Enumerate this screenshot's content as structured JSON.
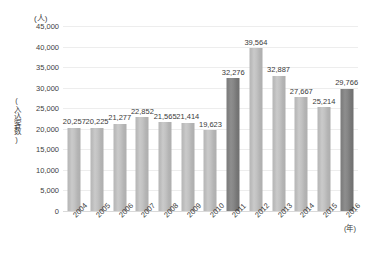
{
  "chart_data": {
    "type": "bar",
    "title": "",
    "subtitle": "",
    "unit_caption": "(人)",
    "ylabel": "(入込客数)",
    "xlabel": "(年)",
    "categories": [
      "2004",
      "2005",
      "2006",
      "2007",
      "2008",
      "2009",
      "2010",
      "2011",
      "2012",
      "2013",
      "2014",
      "2015",
      "2016"
    ],
    "values": [
      20257,
      20225,
      21277,
      22852,
      21565,
      21414,
      19623,
      32276,
      39564,
      32887,
      27667,
      25214,
      29766
    ],
    "value_labels": [
      "20,257",
      "20,225",
      "21,277",
      "22,852",
      "21,565",
      "21,414",
      "19,623",
      "32,276",
      "39,564",
      "32,887",
      "27,667",
      "25,214",
      "29,766"
    ],
    "highlighted": [
      false,
      false,
      false,
      false,
      false,
      false,
      false,
      true,
      false,
      false,
      false,
      false,
      true
    ],
    "ylim": [
      0,
      45000
    ],
    "ytick_values": [
      0,
      5000,
      10000,
      15000,
      20000,
      25000,
      30000,
      35000,
      40000,
      45000
    ],
    "ytick_labels": [
      "0",
      "5,000",
      "10,000",
      "15,000",
      "20,000",
      "25,000",
      "30,000",
      "35,000",
      "40,000",
      "45,000"
    ],
    "grid": true,
    "legend": "none",
    "colors": {
      "bar": "#c0c0c0",
      "bar_highlight": "#828282",
      "gridline": "#ededed",
      "baseline": "#d9d9d9",
      "text": "#3a3a3a"
    }
  }
}
